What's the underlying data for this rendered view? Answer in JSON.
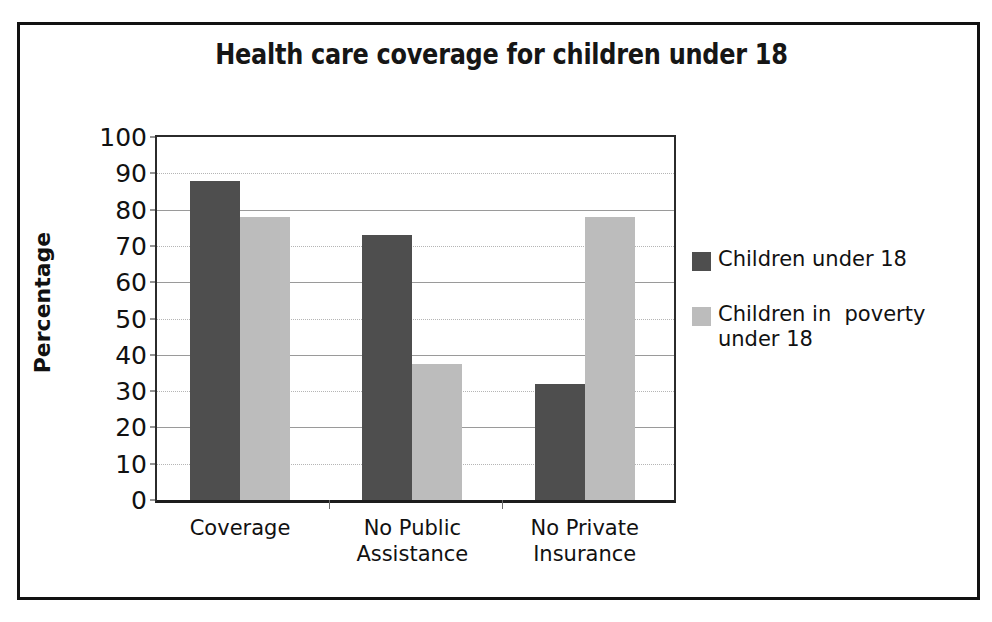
{
  "chart_data": {
    "type": "bar",
    "title": "Health care coverage for children under 18",
    "xlabel": "",
    "ylabel": "Percentage",
    "ylim": [
      0,
      100
    ],
    "ytick_step": 10,
    "grid": true,
    "legend_position": "right",
    "categories": [
      "Coverage",
      "No Public Assistance",
      "No Private Insurance"
    ],
    "category_lines": [
      [
        "Coverage"
      ],
      [
        "No Public",
        "Assistance"
      ],
      [
        "No Private",
        "Insurance"
      ]
    ],
    "ytick_labels": [
      "100",
      "90",
      "80",
      "70",
      "60",
      "50",
      "40",
      "30",
      "20",
      "10",
      "0"
    ],
    "series": [
      {
        "name": "Children under 18",
        "color": "#4e4e4e",
        "values": [
          88,
          73,
          32
        ]
      },
      {
        "name": "Children in  poverty under 18",
        "color": "#bcbcbc",
        "values": [
          78,
          37.5,
          78
        ]
      }
    ]
  },
  "legend": {
    "entries": [
      {
        "label": "Children under 18",
        "swatch": "dark-gray-swatch"
      },
      {
        "label": "Children in  poverty\nunder 18",
        "swatch": "light-gray-swatch"
      }
    ]
  },
  "colors": {
    "series_dark": "#4e4e4e",
    "series_light": "#bcbcbc",
    "frame": "#111111",
    "axis": "#2b2b2b",
    "gridline": "#b5b5b5",
    "text": "#111111",
    "background": "#ffffff"
  }
}
